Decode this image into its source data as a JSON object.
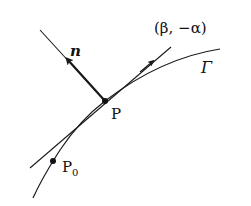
{
  "diagram": {
    "labels": {
      "normal": "n",
      "tangent_direction": "(β, −α)",
      "curve": "Γ",
      "point": "P",
      "initial_point": "P",
      "initial_point_subscript": "0"
    },
    "colors": {
      "stroke": "#1a1a1a",
      "background": "#ffffff"
    }
  }
}
